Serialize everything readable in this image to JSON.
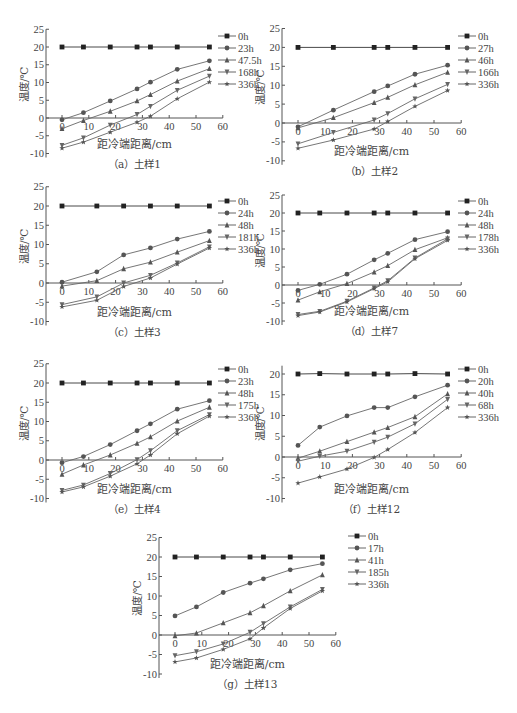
{
  "figure": {
    "ylabel": "温度/℃",
    "xlabel": "距冷端距离/cm"
  },
  "chart_data": [
    {
      "id": "a",
      "type": "line",
      "caption": "（a）土样1",
      "xlabel": "距冷端距离/cm",
      "ylabel": "温度/℃",
      "xlim": [
        0,
        60
      ],
      "ylim": [
        -10,
        25
      ],
      "xticks": [
        0,
        10,
        20,
        30,
        40,
        50,
        60
      ],
      "yticks": [
        -10,
        -5,
        0,
        5,
        10,
        15,
        20,
        25
      ],
      "x": [
        0,
        8,
        18,
        28,
        33,
        43,
        55
      ],
      "series": [
        {
          "name": "0h",
          "marker": "square",
          "values": [
            20,
            20,
            20,
            20,
            20,
            20,
            20
          ]
        },
        {
          "name": "23h",
          "marker": "circle",
          "values": [
            -0.5,
            1.5,
            4.8,
            8.2,
            10.1,
            13.7,
            16.1
          ]
        },
        {
          "name": "47.5h",
          "marker": "triangle-up",
          "values": [
            -3.0,
            -0.7,
            1.9,
            4.8,
            6.6,
            10.4,
            13.9
          ]
        },
        {
          "name": "168h",
          "marker": "triangle-down",
          "values": [
            -7.7,
            -5.6,
            -2.0,
            1.0,
            3.3,
            7.8,
            11.8
          ]
        },
        {
          "name": "336h",
          "marker": "star",
          "values": [
            -8.5,
            -6.8,
            -4.0,
            -1.2,
            0.5,
            5.4,
            10.1
          ]
        }
      ]
    },
    {
      "id": "b",
      "type": "line",
      "caption": "（b）土样2",
      "xlabel": "距冷端距离/cm",
      "ylabel": "温度/℃",
      "xlim": [
        0,
        60
      ],
      "ylim": [
        -10,
        25
      ],
      "xticks": [
        0,
        10,
        20,
        30,
        40,
        50,
        60
      ],
      "yticks": [
        -10,
        -5,
        0,
        5,
        10,
        15,
        20,
        25
      ],
      "x": [
        0,
        13,
        28,
        33,
        43,
        55
      ],
      "series": [
        {
          "name": "0h",
          "marker": "square",
          "values": [
            20,
            20,
            20,
            20,
            20,
            20
          ]
        },
        {
          "name": "27h",
          "marker": "circle",
          "values": [
            -1.0,
            3.4,
            8.3,
            9.8,
            12.9,
            15.3
          ]
        },
        {
          "name": "46h",
          "marker": "triangle-up",
          "values": [
            -1.3,
            1.4,
            5.4,
            6.8,
            10.1,
            13.4
          ]
        },
        {
          "name": "166h",
          "marker": "triangle-down",
          "values": [
            -5.5,
            -2.5,
            0.8,
            2.5,
            6.4,
            10.2
          ]
        },
        {
          "name": "336h",
          "marker": "star",
          "values": [
            -6.7,
            -4.5,
            -1.6,
            0.4,
            4.4,
            8.6
          ]
        }
      ]
    },
    {
      "id": "c",
      "type": "line",
      "caption": "（c）土样3",
      "xlabel": "距冷端距离/cm",
      "ylabel": "温度/℃",
      "xlim": [
        0,
        60
      ],
      "ylim": [
        -10,
        25
      ],
      "xticks": [
        0,
        10,
        20,
        30,
        40,
        50,
        60
      ],
      "yticks": [
        -10,
        -5,
        0,
        5,
        10,
        15,
        20,
        25
      ],
      "x": [
        0,
        13,
        23,
        33,
        43,
        55
      ],
      "series": [
        {
          "name": "0h",
          "marker": "square",
          "values": [
            20,
            20,
            20,
            20,
            20,
            20
          ]
        },
        {
          "name": "24h",
          "marker": "circle",
          "values": [
            0.2,
            2.9,
            7.3,
            9.1,
            11.4,
            13.4
          ]
        },
        {
          "name": "48h",
          "marker": "triangle-up",
          "values": [
            -0.8,
            0.6,
            3.7,
            5.4,
            8.0,
            11.0
          ]
        },
        {
          "name": "181h",
          "marker": "triangle-down",
          "values": [
            -5.6,
            -3.6,
            0.0,
            2.0,
            5.2,
            9.4
          ]
        },
        {
          "name": "336h",
          "marker": "star",
          "values": [
            -6.2,
            -4.5,
            -0.9,
            1.3,
            4.9,
            9.1
          ]
        }
      ]
    },
    {
      "id": "d",
      "type": "line",
      "caption": "（d）土样7",
      "xlabel": "距冷端距离/cm",
      "ylabel": "温度/℃",
      "xlim": [
        0,
        60
      ],
      "ylim": [
        -10,
        25
      ],
      "xticks": [
        0,
        10,
        20,
        30,
        40,
        50,
        60
      ],
      "yticks": [
        -10,
        -5,
        0,
        5,
        10,
        15,
        20,
        25
      ],
      "x": [
        0,
        8,
        18,
        28,
        33,
        43,
        55
      ],
      "series": [
        {
          "name": "0h",
          "marker": "square",
          "values": [
            20,
            20,
            20,
            20,
            20,
            20,
            20
          ]
        },
        {
          "name": "24h",
          "marker": "circle",
          "values": [
            -1.5,
            0.2,
            3.0,
            7.0,
            8.8,
            12.6,
            14.8
          ]
        },
        {
          "name": "48h",
          "marker": "triangle-up",
          "values": [
            -4.2,
            -1.9,
            0.4,
            3.6,
            5.4,
            9.8,
            13.1
          ]
        },
        {
          "name": "178h",
          "marker": "triangle-down",
          "values": [
            -8.2,
            -7.3,
            -4.5,
            -0.8,
            1.2,
            7.5,
            12.8
          ]
        },
        {
          "name": "336h",
          "marker": "star",
          "values": [
            -8.5,
            -7.5,
            -4.7,
            -1.0,
            0.9,
            7.3,
            12.4
          ]
        }
      ]
    },
    {
      "id": "e",
      "type": "line",
      "caption": "（e）土样4",
      "xlabel": "距冷端距离/cm",
      "ylabel": "温度/℃",
      "xlim": [
        0,
        60
      ],
      "ylim": [
        -10,
        25
      ],
      "xticks": [
        0,
        10,
        20,
        30,
        40,
        50,
        60
      ],
      "yticks": [
        -10,
        -5,
        0,
        5,
        10,
        15,
        20,
        25
      ],
      "x": [
        0,
        8,
        18,
        28,
        33,
        43,
        55
      ],
      "series": [
        {
          "name": "0h",
          "marker": "square",
          "values": [
            20,
            20,
            20,
            20,
            20,
            20,
            20
          ]
        },
        {
          "name": "23h",
          "marker": "circle",
          "values": [
            -0.7,
            0.9,
            4.0,
            7.6,
            9.4,
            13.2,
            15.4
          ]
        },
        {
          "name": "48h",
          "marker": "triangle-up",
          "values": [
            -3.7,
            -1.3,
            1.3,
            4.3,
            6.0,
            10.1,
            13.7
          ]
        },
        {
          "name": "175h",
          "marker": "triangle-down",
          "values": [
            -7.9,
            -6.5,
            -3.5,
            0.1,
            2.4,
            7.6,
            11.8
          ]
        },
        {
          "name": "336h",
          "marker": "star",
          "values": [
            -8.3,
            -7.0,
            -4.2,
            -1.0,
            1.3,
            6.8,
            11.4
          ]
        }
      ]
    },
    {
      "id": "f",
      "type": "line",
      "caption": "（f）土样12",
      "xlabel": "距冷端距离/cm",
      "ylabel": "温度/℃",
      "xlim": [
        0,
        60
      ],
      "ylim": [
        -10,
        22
      ],
      "xticks": [
        0,
        10,
        20,
        30,
        40,
        50,
        60
      ],
      "yticks": [
        -10,
        -5,
        0,
        5,
        10,
        15,
        20
      ],
      "x": [
        0,
        8,
        18,
        28,
        33,
        43,
        55
      ],
      "series": [
        {
          "name": "0h",
          "marker": "square",
          "values": [
            20,
            20.1,
            20,
            20,
            20,
            20.1,
            20
          ]
        },
        {
          "name": "20h",
          "marker": "circle",
          "values": [
            2.8,
            7.2,
            9.9,
            11.9,
            11.9,
            14.5,
            17.3
          ]
        },
        {
          "name": "40h",
          "marker": "triangle-up",
          "values": [
            -0.3,
            1.4,
            3.7,
            6.0,
            7.1,
            9.7,
            15.2
          ]
        },
        {
          "name": "68h",
          "marker": "triangle-down",
          "values": [
            -1.0,
            0.2,
            1.4,
            3.6,
            4.8,
            8.0,
            13.9
          ]
        },
        {
          "name": "336h",
          "marker": "star",
          "values": [
            -6.3,
            -4.8,
            -2.9,
            -0.1,
            1.8,
            5.9,
            11.9
          ]
        }
      ]
    },
    {
      "id": "g",
      "type": "line",
      "caption": "（g）土样13",
      "xlabel": "距冷端距离/cm",
      "ylabel": "温度/℃",
      "xlim": [
        0,
        60
      ],
      "ylim": [
        -10,
        25
      ],
      "xticks": [
        0,
        10,
        20,
        30,
        40,
        50,
        60
      ],
      "yticks": [
        -10,
        -5,
        0,
        5,
        10,
        15,
        20,
        25
      ],
      "x": [
        0,
        8,
        18,
        28,
        33,
        43,
        55
      ],
      "series": [
        {
          "name": "0h",
          "marker": "square",
          "values": [
            20,
            20,
            20,
            20,
            20,
            20,
            20
          ]
        },
        {
          "name": "17h",
          "marker": "circle",
          "values": [
            4.9,
            7.2,
            10.9,
            13.3,
            14.4,
            16.7,
            18.3
          ]
        },
        {
          "name": "41h",
          "marker": "triangle-up",
          "values": [
            -0.2,
            0.5,
            3.1,
            5.7,
            7.5,
            11.3,
            15.4
          ]
        },
        {
          "name": "185h",
          "marker": "triangle-down",
          "values": [
            -5.3,
            -4.3,
            -2.3,
            0.7,
            2.9,
            7.2,
            11.7
          ]
        },
        {
          "name": "336h",
          "marker": "star",
          "values": [
            -6.9,
            -5.9,
            -3.7,
            -1.0,
            1.8,
            6.8,
            11.3
          ]
        }
      ]
    }
  ],
  "layout": {
    "panels": [
      {
        "id": "a",
        "left": 0,
        "top": 0,
        "ox": 62,
        "oy": 118,
        "xs": 2.68,
        "ys": 3.55,
        "legx": 218,
        "legy": 36
      },
      {
        "id": "b",
        "left": 258,
        "top": 0,
        "ox": 40,
        "oy": 123,
        "xs": 2.72,
        "ys": 3.78,
        "legx": 200,
        "legy": 36
      },
      {
        "id": "c",
        "left": 0,
        "top": 190,
        "ox": 62,
        "oy": 93,
        "xs": 2.68,
        "ys": 3.85,
        "legx": 218,
        "legy": 11
      },
      {
        "id": "d",
        "left": 258,
        "top": 190,
        "ox": 40,
        "oy": 95,
        "xs": 2.72,
        "ys": 3.6,
        "legx": 200,
        "legy": 11
      },
      {
        "id": "e",
        "left": 0,
        "top": 355,
        "ox": 62,
        "oy": 105,
        "xs": 2.68,
        "ys": 3.85,
        "legx": 218,
        "legy": 14
      },
      {
        "id": "f",
        "left": 258,
        "top": 355,
        "ox": 40,
        "oy": 102,
        "xs": 2.72,
        "ys": 4.15,
        "legx": 200,
        "legy": 14
      },
      {
        "id": "g",
        "left": 120,
        "top": 520,
        "ox": 55,
        "oy": 115,
        "xs": 2.68,
        "ys": 3.9,
        "legx": 228,
        "legy": 16
      }
    ]
  }
}
